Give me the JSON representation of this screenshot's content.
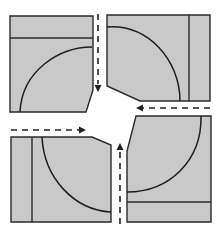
{
  "diagram": {
    "title": "",
    "type": "four-block traffic circulation diagram",
    "colors": {
      "block_fill": "#c9c9c9",
      "outline": "#2a2a2a",
      "background": "#ffffff",
      "arrow": "#222222"
    },
    "blocks": [
      {
        "id": "top-left",
        "band": "top",
        "arc": true,
        "chamfer": "bottom-right"
      },
      {
        "id": "top-right",
        "band": "right",
        "arc": true,
        "chamfer": "bottom-left"
      },
      {
        "id": "bottom-left",
        "band": "left",
        "arc": true,
        "chamfer": "top-right"
      },
      {
        "id": "bottom-right",
        "band": "bottom",
        "arc": true,
        "chamfer": "top-left"
      }
    ],
    "flows": [
      {
        "id": "flow-down",
        "direction": "down",
        "style": "dashed"
      },
      {
        "id": "flow-left",
        "direction": "left",
        "style": "dashed"
      },
      {
        "id": "flow-right",
        "direction": "right",
        "style": "dashed"
      },
      {
        "id": "flow-up",
        "direction": "up",
        "style": "dashed"
      }
    ],
    "center": {
      "label": ""
    }
  }
}
